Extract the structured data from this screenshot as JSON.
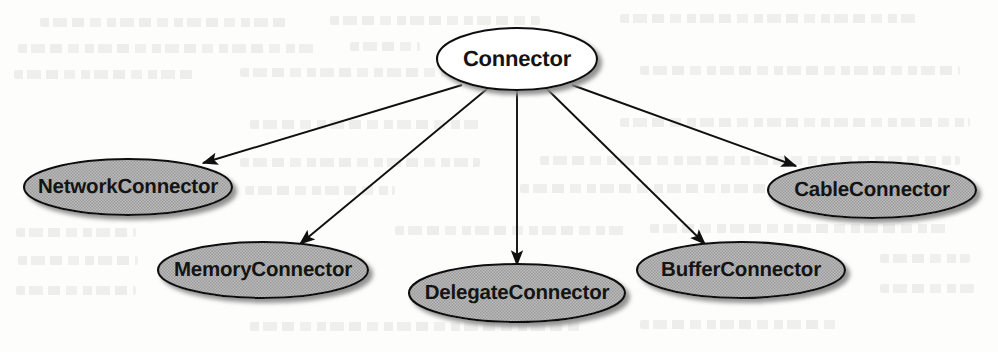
{
  "diagram": {
    "kind": "uml-inheritance-diagram",
    "canvas": {
      "width": 998,
      "height": 352
    },
    "style": {
      "root_fill": "#ffffff",
      "child_fill": "#b2b2b2",
      "stroke": "#101010",
      "text_color": "#141414",
      "shadow": "#8d8d8d",
      "background": "#fdfdfc"
    },
    "root": {
      "id": "connector",
      "label": "Connector",
      "cx": 517,
      "cy": 59,
      "rx": 80,
      "ry": 31,
      "fill": "#ffffff"
    },
    "children": [
      {
        "id": "network-connector",
        "label": "NetworkConnector",
        "cx": 128,
        "cy": 187,
        "rx": 104,
        "ry": 28,
        "fill": "#b2b2b2",
        "arrow_tip_x": 203,
        "arrow_tip_y": 163
      },
      {
        "id": "memory-connector",
        "label": "MemoryConnector",
        "cx": 263,
        "cy": 270,
        "rx": 105,
        "ry": 28,
        "fill": "#b2b2b2",
        "arrow_tip_x": 300,
        "arrow_tip_y": 244
      },
      {
        "id": "delegate-connector",
        "label": "DelegateConnector",
        "cx": 517,
        "cy": 293,
        "rx": 108,
        "ry": 29,
        "fill": "#b2b2b2",
        "arrow_tip_x": 517,
        "arrow_tip_y": 265
      },
      {
        "id": "buffer-connector",
        "label": "BufferConnector",
        "cx": 741,
        "cy": 270,
        "rx": 104,
        "ry": 28,
        "fill": "#b2b2b2",
        "arrow_tip_x": 705,
        "arrow_tip_y": 244
      },
      {
        "id": "cable-connector",
        "label": "CableConnector",
        "cx": 872,
        "cy": 190,
        "rx": 104,
        "ry": 28,
        "fill": "#b2b2b2",
        "arrow_tip_x": 796,
        "arrow_tip_y": 166
      }
    ],
    "edges": [
      {
        "id": "edge-network",
        "from": "connector",
        "to": "network-connector",
        "x1": 462,
        "y1": 85,
        "x2": 203,
        "y2": 163
      },
      {
        "id": "edge-memory",
        "from": "connector",
        "to": "memory-connector",
        "x1": 487,
        "y1": 89,
        "x2": 300,
        "y2": 244
      },
      {
        "id": "edge-delegate",
        "from": "connector",
        "to": "delegate-connector",
        "x1": 517,
        "y1": 90,
        "x2": 517,
        "y2": 265
      },
      {
        "id": "edge-buffer",
        "from": "connector",
        "to": "buffer-connector",
        "x1": 547,
        "y1": 89,
        "x2": 705,
        "y2": 244
      },
      {
        "id": "edge-cable",
        "from": "connector",
        "to": "cable-connector",
        "x1": 572,
        "y1": 85,
        "x2": 796,
        "y2": 166
      }
    ]
  }
}
